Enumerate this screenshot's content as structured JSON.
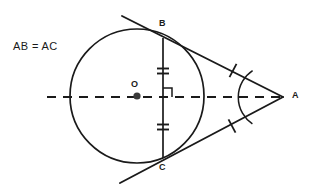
{
  "figure": {
    "kind": "geometry-diagram",
    "title_note": "AB = AC",
    "background_color": "#ffffff",
    "stroke_color": "#1a1a1a",
    "labels": {
      "note": "AB = AC",
      "center": "O",
      "tangent_point_top": "B",
      "tangent_point_bottom": "C",
      "external_point": "A"
    },
    "circle": {
      "center_x": 137,
      "center_y": 96,
      "radius": 67
    },
    "points": {
      "O": {
        "x": 137,
        "y": 96
      },
      "B": {
        "x": 163,
        "y": 38
      },
      "C": {
        "x": 163,
        "y": 158
      },
      "A": {
        "x": 283,
        "y": 97
      },
      "M": {
        "x": 163,
        "y": 97
      }
    },
    "label_positions": {
      "note": {
        "x": 13,
        "y": 41
      },
      "O": {
        "x": 131,
        "y": 80
      },
      "B": {
        "x": 159,
        "y": 19
      },
      "C": {
        "x": 159,
        "y": 163
      },
      "A": {
        "x": 292,
        "y": 91
      }
    },
    "axis_line": {
      "x1": 47,
      "y1": 97,
      "x2": 283,
      "y2": 97,
      "style": "dashed",
      "dash_pattern": "9 7"
    },
    "tangent_top": {
      "x1": 122,
      "y1": 16,
      "x2": 283,
      "y2": 97
    },
    "tangent_bottom": {
      "x1": 120,
      "y1": 183,
      "x2": 283,
      "y2": 97
    },
    "chord": {
      "x1": 163,
      "y1": 38,
      "x2": 163,
      "y2": 158
    },
    "right_angle_marker": {
      "corner_x": 163,
      "corner_y": 97,
      "size": 9,
      "direction": "up-right"
    },
    "tick_marks": {
      "chord_upper": {
        "x": 163,
        "y": 71,
        "count": 2,
        "spacing": 5,
        "half_width": 6
      },
      "chord_lower": {
        "x": 163,
        "y": 127,
        "count": 2,
        "spacing": 5,
        "half_width": 6
      },
      "tangent_upper": {
        "x": 233,
        "y": 71,
        "count": 1,
        "half_length": 7
      },
      "tangent_lower": {
        "x": 232,
        "y": 126,
        "count": 1,
        "half_length": 7
      }
    },
    "angle_arc": {
      "vertex_x": 283,
      "vertex_y": 97,
      "radius": 32,
      "label": "angle-A-arc"
    },
    "center_dot": {
      "x": 137,
      "y": 96,
      "radius": 3.6
    }
  }
}
